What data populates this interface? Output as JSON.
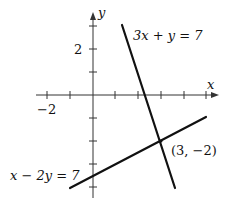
{
  "figure": {
    "axes": {
      "x_label": "x",
      "y_label": "y",
      "x_tick_label": "−2",
      "y_tick_label": "2",
      "x_ticks": [
        -2,
        -1,
        1,
        2,
        3,
        4,
        5
      ],
      "y_ticks": [
        2,
        1,
        -1,
        -2,
        -3,
        -4
      ]
    },
    "lines": [
      {
        "equation": "3x + y = 7"
      },
      {
        "equation": "x − 2y = 7"
      }
    ],
    "intersection": {
      "label": "(3, −2)",
      "x": 3,
      "y": -2
    },
    "colors": {
      "line": "#111111",
      "axis": "#333333",
      "background": "#ffffff"
    }
  }
}
